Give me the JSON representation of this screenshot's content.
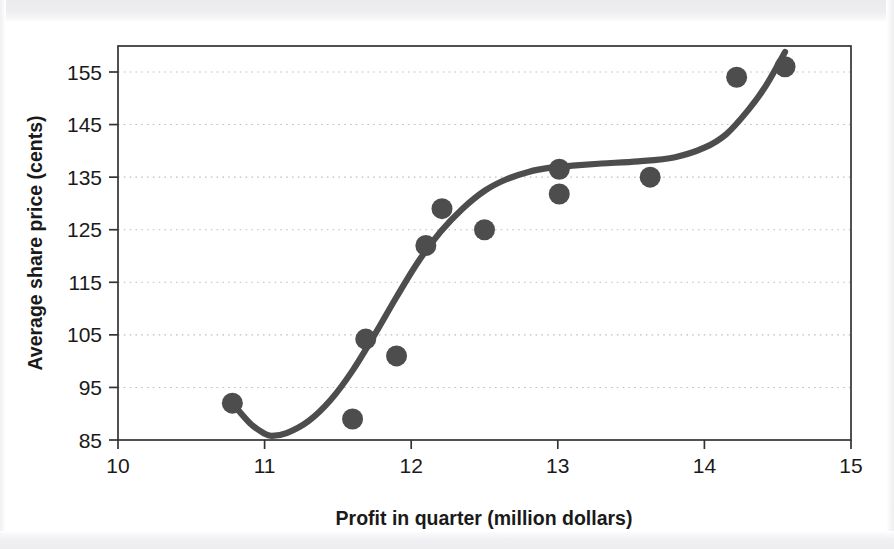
{
  "chart_data": {
    "type": "scatter",
    "title": "",
    "xlabel": "Profit in quarter (million dollars)",
    "ylabel": "Average share price (cents)",
    "xlim": [
      10,
      15
    ],
    "ylim": [
      85,
      158.8
    ],
    "xticks": [
      10,
      11,
      12,
      13,
      14,
      15
    ],
    "xtick_labels": [
      "10",
      "11",
      "12",
      "13",
      "14",
      "15"
    ],
    "yticks": [
      85,
      95,
      105,
      115,
      125,
      135,
      145,
      155
    ],
    "ytick_labels": [
      "85",
      "95",
      "105",
      "115",
      "125",
      "135",
      "145",
      "155"
    ],
    "grid": "horizontal-dotted",
    "legend": "none",
    "marker": "filled-circle",
    "marker_color": "#4d4d4d",
    "line_color": "#4d4d4d",
    "points": [
      {
        "x": 10.78,
        "y": 92.0
      },
      {
        "x": 11.6,
        "y": 89.0
      },
      {
        "x": 11.69,
        "y": 104.2
      },
      {
        "x": 11.9,
        "y": 101.0
      },
      {
        "x": 12.1,
        "y": 122.0
      },
      {
        "x": 12.21,
        "y": 129.0
      },
      {
        "x": 12.5,
        "y": 125.0
      },
      {
        "x": 13.01,
        "y": 136.5
      },
      {
        "x": 13.01,
        "y": 131.8
      },
      {
        "x": 13.63,
        "y": 135.0
      },
      {
        "x": 14.22,
        "y": 154.0
      },
      {
        "x": 14.55,
        "y": 156.0
      }
    ],
    "fit_curve": {
      "name": "smoothed trend line",
      "x": [
        10.78,
        10.9,
        11.0,
        11.05,
        11.15,
        11.3,
        11.45,
        11.6,
        11.75,
        11.9,
        12.05,
        12.2,
        12.35,
        12.5,
        12.65,
        12.8,
        12.95,
        13.1,
        13.3,
        13.55,
        13.8,
        14.0,
        14.15,
        14.3,
        14.42,
        14.55
      ],
      "y": [
        92.0,
        88.2,
        86.2,
        85.8,
        86.3,
        88.6,
        92.6,
        98.2,
        105.0,
        112.2,
        119.0,
        124.6,
        129.0,
        132.4,
        134.6,
        136.0,
        136.8,
        137.2,
        137.6,
        138.0,
        138.8,
        140.6,
        143.2,
        147.8,
        152.4,
        158.8
      ]
    }
  },
  "figure": {
    "background": "#ffffff",
    "axis_color": "#333333",
    "grid_color": "#bfbfbf",
    "text_color": "#1a1a1a"
  }
}
